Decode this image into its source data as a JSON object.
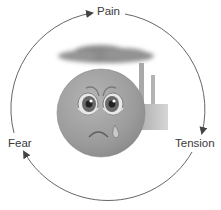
{
  "diagram": {
    "type": "cycle",
    "nodes": [
      {
        "id": "pain",
        "label": "Pain"
      },
      {
        "id": "tension",
        "label": "Tension"
      },
      {
        "id": "fear",
        "label": "Fear"
      }
    ],
    "edges": [
      {
        "from": "pain",
        "to": "tension"
      },
      {
        "from": "tension",
        "to": "fear"
      },
      {
        "from": "fear",
        "to": "pain"
      }
    ],
    "center_illustration": {
      "icons": [
        "sad-crying-face-icon",
        "smog-cloud-icon",
        "factory-icon"
      ]
    },
    "colors": {
      "arrow": "#555555",
      "face": "#9a9a9a",
      "cloud": "#8c8c8c",
      "factory": "#b0b0b0",
      "text": "#3a3a3a"
    }
  }
}
